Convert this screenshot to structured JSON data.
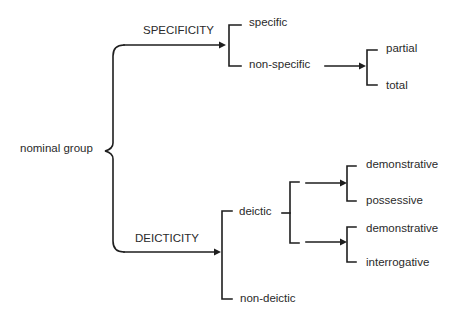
{
  "diagram": {
    "type": "system network",
    "root": "nominal group",
    "systems": {
      "specificity": {
        "label": "SPECIFICITY",
        "options": [
          "specific",
          "non-specific"
        ],
        "non_specific_options": [
          "partial",
          "total"
        ]
      },
      "deicticity": {
        "label": "DEICTICITY",
        "options": [
          "deictic",
          "non-deictic"
        ],
        "deictic_subsystems": [
          {
            "options": [
              "demonstrative",
              "possessive"
            ]
          },
          {
            "options": [
              "demonstrative",
              "interrogative"
            ]
          }
        ]
      }
    }
  },
  "colors": {
    "background": "#ffffff",
    "line": "#1e1e1e",
    "text": "#2a2a2a"
  }
}
